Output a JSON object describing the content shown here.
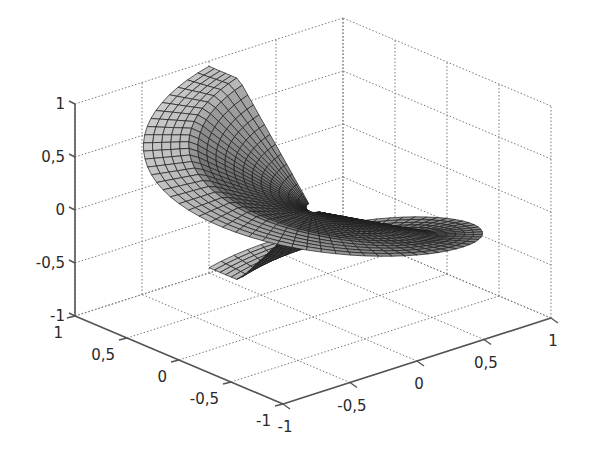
{
  "chart_data": {
    "type": "surface3d",
    "title": "",
    "xlabel": "",
    "ylabel": "",
    "zlabel": "",
    "xlim": [
      -1,
      1
    ],
    "ylim": [
      -1,
      1
    ],
    "zlim": [
      -1,
      1
    ],
    "grid": true,
    "box": true,
    "x_ticks": [
      {
        "value": 1,
        "label": "1"
      },
      {
        "value": 0.5,
        "label": "0,5"
      },
      {
        "value": 0,
        "label": "0"
      },
      {
        "value": -0.5,
        "label": "-0,5"
      },
      {
        "value": -1,
        "label": "-1"
      }
    ],
    "y_ticks": [
      {
        "value": -1,
        "label": "-1"
      },
      {
        "value": -0.5,
        "label": "-0,5"
      },
      {
        "value": 0,
        "label": "0"
      },
      {
        "value": 0.5,
        "label": "0,5"
      },
      {
        "value": 1,
        "label": "1"
      }
    ],
    "z_ticks": [
      {
        "value": 1,
        "label": "1"
      },
      {
        "value": 0.5,
        "label": "0,5"
      },
      {
        "value": 0,
        "label": "0"
      },
      {
        "value": -0.5,
        "label": "-0,5"
      },
      {
        "value": -1,
        "label": "-1"
      }
    ],
    "surface": {
      "parametrization": "r in [0,1], theta in [0, 2*pi]; x = r*cos(theta), y = r*sin(theta), z = r*sin(theta/2) style twist",
      "radial_segments": 18,
      "angular_segments": 72,
      "colormap": "gray",
      "mesh_color": "#1c1c1c",
      "shade_light": "#d9d9d9",
      "shade_dark": "#1a1a1a"
    }
  },
  "colors": {
    "background": "#ffffff",
    "axis": "#555555",
    "grid": "#7a7a7a",
    "label": "#2a2a2a"
  }
}
